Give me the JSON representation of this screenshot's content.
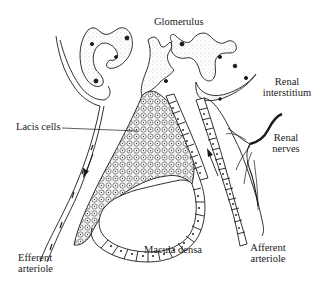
{
  "diagram": {
    "labels": {
      "glomerulus": "Glomerulus",
      "renal_interstitium_line1": "Renal",
      "renal_interstitium_line2": "interstitium",
      "lacis_cells": "Lacis cells",
      "renal_nerves_line1": "Renal",
      "renal_nerves_line2": "nerves",
      "efferent_arteriole_line1": "Efferent",
      "efferent_arteriole_line2": "arteriole",
      "macula_densa": "Macula densa",
      "afferent_arteriole_line1": "Afferent",
      "afferent_arteriole_line2": "arteriole"
    },
    "flow_arrows": [
      {
        "vessel": "efferent arteriole",
        "direction": "down"
      },
      {
        "vessel": "afferent arteriole",
        "direction": "up"
      }
    ],
    "colors": {
      "ink": "#1a1a1a",
      "stipple": "#d9d9d9",
      "background": "#ffffff"
    }
  }
}
